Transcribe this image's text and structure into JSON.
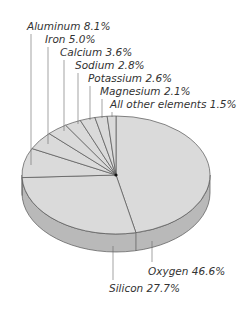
{
  "chart_data": {
    "type": "pie",
    "style": "3d-tilted",
    "title": "",
    "categories": [
      "Oxygen",
      "Silicon",
      "Aluminum",
      "Iron",
      "Calcium",
      "Sodium",
      "Potassium",
      "Magnesium",
      "All other elements"
    ],
    "values": [
      46.6,
      27.7,
      8.1,
      5.0,
      3.6,
      2.8,
      2.6,
      2.1,
      1.5
    ],
    "unit": "%",
    "labels": [
      {
        "name": "Oxygen",
        "text": "Oxygen 46.6%"
      },
      {
        "name": "Silicon",
        "text": "Silicon  27.7%"
      },
      {
        "name": "Aluminum",
        "text": "Aluminum  8.1%"
      },
      {
        "name": "Iron",
        "text": "Iron 5.0%"
      },
      {
        "name": "Calcium",
        "text": "Calcium  3.6%"
      },
      {
        "name": "Sodium",
        "text": "Sodium  2.8%"
      },
      {
        "name": "Potassium",
        "text": "Potassium  2.6%"
      },
      {
        "name": "Magnesium",
        "text": "Magnesium  2.1%"
      },
      {
        "name": "All other elements",
        "text": "All other elements  1.5%"
      }
    ],
    "colors": {
      "top": "#dadada",
      "side": "#b9b9b9",
      "edge": "#555555",
      "leader": "#666666"
    },
    "legend": "none (direct labels with leader lines)"
  }
}
